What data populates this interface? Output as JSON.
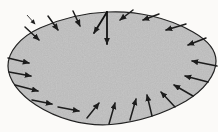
{
  "labels": {
    "curve": "C",
    "region": "R",
    "vector_v": "v",
    "vector_n": "n",
    "angle_theta": "θ"
  },
  "colors": {
    "region_fill": "#c6c6c6",
    "line": "#1c1c1c",
    "background": "#fbfaf8"
  },
  "geometry": {
    "blob_path": "M 8,66 C 8,52 20,37 40,28 C 60,19 84,13 108,12 C 136,10.5 168,17.5 193,32 C 207,40 216,50 216,61 C 216,75 204,90 186,101 C 166,112.5 139,122 111,124.5 C 83,126.5 56,118 36,105 C 20,94.5 8,80 8,66 Z",
    "field_arrows": [
      [
        25,
        27,
        39,
        40
      ],
      [
        48,
        16,
        58,
        30
      ],
      [
        73,
        11,
        80,
        26
      ],
      [
        133,
        10,
        120,
        20
      ],
      [
        159,
        14,
        143,
        20
      ],
      [
        186,
        24,
        166,
        30
      ],
      [
        206,
        38,
        188,
        45
      ],
      [
        217,
        66,
        192,
        61
      ],
      [
        208,
        82,
        185,
        76
      ],
      [
        193,
        96,
        174,
        85
      ],
      [
        175,
        107,
        161,
        92
      ],
      [
        152,
        116,
        147,
        95
      ],
      [
        130,
        120,
        136,
        99
      ],
      [
        109,
        124,
        115,
        103
      ],
      [
        87,
        118,
        99,
        103
      ],
      [
        58,
        107,
        79,
        111
      ],
      [
        32,
        100,
        52,
        104
      ],
      [
        15,
        85,
        38,
        91
      ],
      [
        9,
        72,
        31,
        76
      ],
      [
        8,
        58,
        29,
        63
      ]
    ],
    "v_arrow": [
      107,
      12,
      94,
      33
    ],
    "n_arrow": [
      107,
      12,
      107,
      44
    ],
    "curve_pointer": [
      27,
      15,
      35,
      24
    ],
    "label_positions": {
      "curve": [
        21,
        14
      ],
      "region": [
        157,
        62
      ],
      "vector_v": [
        94,
        21
      ],
      "vector_n": [
        120,
        35
      ],
      "angle_theta": [
        101,
        35
      ]
    }
  }
}
